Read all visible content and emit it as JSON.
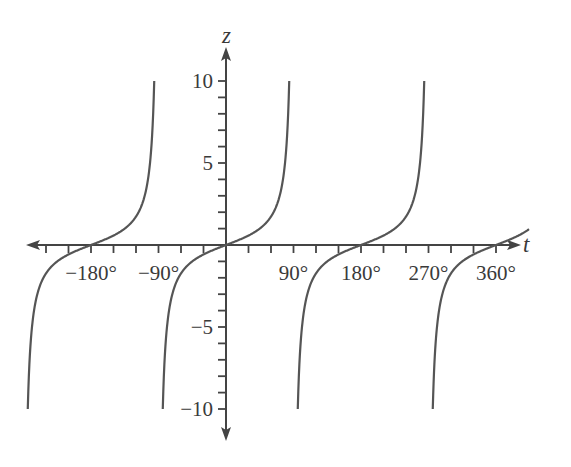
{
  "chart_data": {
    "type": "line",
    "title": "",
    "function": "z = tan t",
    "xlabel": "t",
    "ylabel": "z",
    "xlim": [
      -270,
      405
    ],
    "ylim": [
      -10,
      10
    ],
    "x_tick_step_deg": 30,
    "y_tick_step": 1,
    "x_tick_labels": [
      "−180°",
      "−90°",
      "90°",
      "180°",
      "270°",
      "360°"
    ],
    "x_tick_label_values": [
      -180,
      -90,
      90,
      180,
      270,
      360
    ],
    "y_tick_labels": [
      "10",
      "5",
      "−5",
      "−10"
    ],
    "y_tick_label_values": [
      10,
      5,
      -5,
      -10
    ],
    "grid": false,
    "legend": null,
    "series": [
      {
        "name": "tan t branch 1",
        "t_range": [
          -264.3,
          -95.7
        ],
        "z_range": [
          -10,
          10
        ]
      },
      {
        "name": "tan t branch 2",
        "t_range": [
          -84.3,
          84.3
        ],
        "z_range": [
          -10,
          10
        ]
      },
      {
        "name": "tan t branch 3",
        "t_range": [
          95.7,
          264.3
        ],
        "z_range": [
          -10,
          10
        ]
      },
      {
        "name": "tan t branch 4",
        "t_range": [
          275.7,
          404
        ],
        "z_range": [
          -10,
          1
        ]
      }
    ],
    "zeros": [
      -180,
      0,
      180,
      360
    ],
    "asymptotes": [
      -90,
      90,
      270
    ],
    "color": "#555555"
  },
  "axes": {
    "x_name": "t",
    "y_name": "z"
  }
}
